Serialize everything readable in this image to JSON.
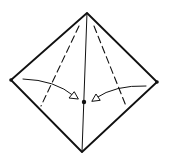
{
  "diagram": {
    "type": "origami-fold-step",
    "stroke_color": "#111111",
    "background": "#ffffff",
    "points": {
      "top": [
        87,
        13
      ],
      "left": [
        11,
        80
      ],
      "right": [
        157,
        82
      ],
      "bottom": [
        82,
        152
      ],
      "center": [
        84,
        102
      ]
    },
    "valley_folds": [
      {
        "from": [
          79,
          26
        ],
        "to": [
          41,
          106
        ]
      },
      {
        "from": [
          94,
          26
        ],
        "to": [
          126,
          106
        ]
      }
    ],
    "crease": {
      "from": [
        87,
        13
      ],
      "to": [
        82,
        152
      ]
    },
    "arrows": [
      {
        "name": "left-flap-arrow",
        "start": [
          23,
          79
        ],
        "ctrl": [
          55,
          80
        ],
        "end": [
          77,
          98
        ]
      },
      {
        "name": "right-flap-arrow",
        "start": [
          146,
          86
        ],
        "ctrl": [
          115,
          85
        ],
        "end": [
          93,
          100
        ]
      }
    ]
  }
}
